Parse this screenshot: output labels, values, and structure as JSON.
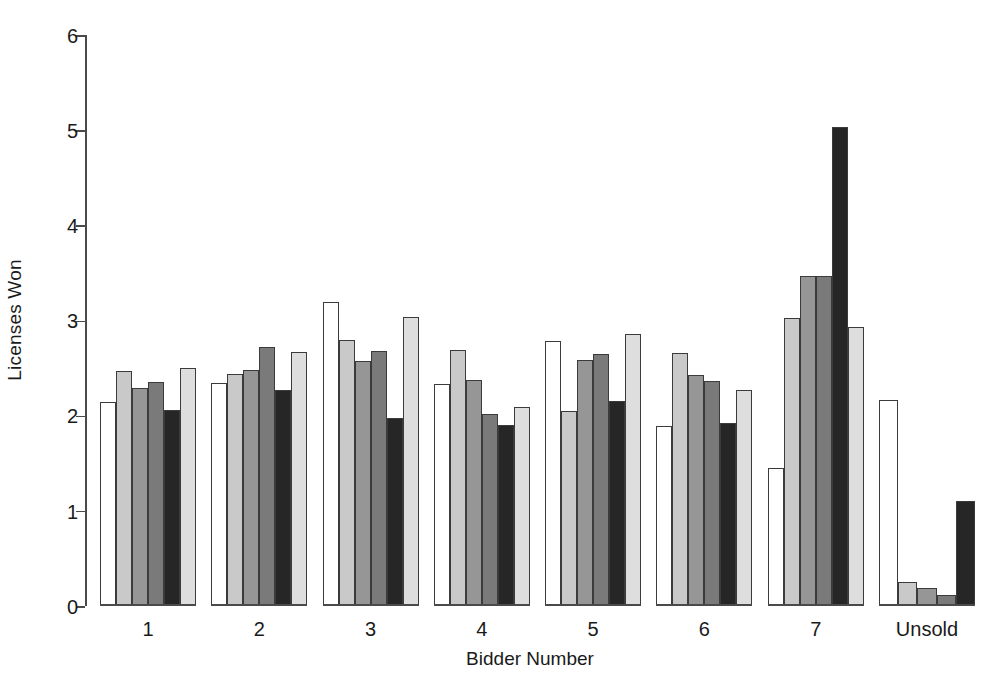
{
  "chart_data": {
    "type": "bar",
    "title": "",
    "xlabel": "Bidder Number",
    "ylabel": "Licenses Won",
    "ylim": [
      0,
      6
    ],
    "yticks": [
      0,
      1,
      2,
      3,
      4,
      5,
      6
    ],
    "grid": false,
    "legend": "none",
    "categories": [
      "1",
      "2",
      "3",
      "4",
      "5",
      "6",
      "7",
      "Unsold"
    ],
    "series": [
      {
        "name": "Series 1",
        "color": "#ffffff",
        "values": [
          2.13,
          2.33,
          3.18,
          2.32,
          2.77,
          1.87,
          1.43,
          2.15
        ]
      },
      {
        "name": "Series 2",
        "color": "#c9c9c9",
        "values": [
          2.45,
          2.42,
          2.78,
          2.67,
          2.03,
          2.64,
          3.01,
          0.24
        ]
      },
      {
        "name": "Series 3",
        "color": "#969696",
        "values": [
          2.27,
          2.46,
          2.56,
          2.36,
          2.57,
          2.41,
          3.45,
          0.17
        ]
      },
      {
        "name": "Series 4",
        "color": "#7a7a7a",
        "values": [
          2.34,
          2.71,
          2.66,
          2.0,
          2.63,
          2.35,
          3.45,
          0.1
        ]
      },
      {
        "name": "Series 5",
        "color": "#262626",
        "values": [
          2.04,
          2.25,
          1.96,
          1.89,
          2.14,
          1.91,
          5.02,
          1.09
        ]
      },
      {
        "name": "Series 6",
        "color": "#dedede",
        "values": [
          2.48,
          2.65,
          3.02,
          2.07,
          2.84,
          2.25,
          2.92,
          null
        ]
      }
    ]
  },
  "axis": {
    "y_title": "Licenses Won",
    "x_title": "Bidder Number",
    "y_tick_labels": [
      "0",
      "1",
      "2",
      "3",
      "4",
      "5",
      "6"
    ]
  },
  "colors": {
    "axis": "#4a4a4a",
    "bar_outline": "#3b3b3b",
    "text": "#1a1a1a",
    "background": "#ffffff"
  }
}
